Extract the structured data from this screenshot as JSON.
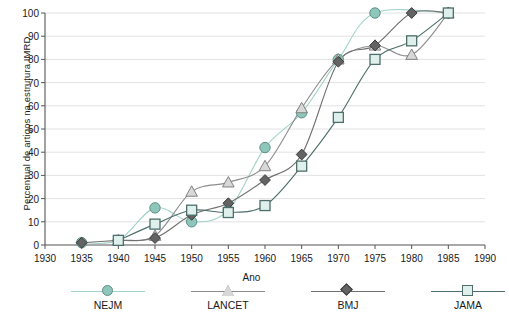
{
  "chart_data": {
    "type": "line",
    "title": "",
    "xlabel": "Ano",
    "ylabel": "Percentual de artigos na estrutura IMRD",
    "xlim": [
      1930,
      1990
    ],
    "ylim": [
      0,
      100
    ],
    "x": [
      1935,
      1940,
      1945,
      1950,
      1955,
      1960,
      1965,
      1970,
      1975,
      1980,
      1985
    ],
    "xticks": [
      1930,
      1935,
      1940,
      1945,
      1950,
      1955,
      1960,
      1965,
      1970,
      1975,
      1980,
      1985,
      1990
    ],
    "yticks": [
      0,
      10,
      20,
      30,
      40,
      50,
      60,
      70,
      80,
      90,
      100
    ],
    "grid": "horizontal",
    "legend_position": "bottom",
    "series": [
      {
        "name": "NEJM",
        "marker": "circle",
        "color": "#8fc6bb",
        "line_color": "#9fd2c8",
        "x": [
          1935,
          1940,
          1945,
          1950,
          1955,
          1960,
          1965,
          1970,
          1975,
          1985
        ],
        "values": [
          1,
          2,
          16,
          10,
          15,
          42,
          57,
          80,
          100,
          100
        ]
      },
      {
        "name": "LANCET",
        "marker": "triangle",
        "color": "#d8d8d8",
        "line_color": "#8c8c8c",
        "x": [
          1940,
          1945,
          1950,
          1955,
          1960,
          1965,
          1970,
          1975,
          1980,
          1985
        ],
        "values": [
          2,
          4,
          23,
          27,
          34,
          59,
          80,
          86,
          82,
          100
        ]
      },
      {
        "name": "BMJ",
        "marker": "diamond",
        "color": "#636363",
        "line_color": "#6f6f6f",
        "x": [
          1935,
          1940,
          1945,
          1950,
          1955,
          1960,
          1965,
          1970,
          1975,
          1980,
          1985
        ],
        "values": [
          1,
          2,
          3,
          13,
          18,
          28,
          39,
          79,
          86,
          100,
          100
        ]
      },
      {
        "name": "JAMA",
        "marker": "square",
        "color": "#dff0ec",
        "line_color": "#4d6e6a",
        "x": [
          1940,
          1945,
          1950,
          1955,
          1960,
          1965,
          1970,
          1975,
          1980,
          1985
        ],
        "values": [
          2,
          9,
          15,
          14,
          17,
          34,
          55,
          80,
          88,
          100
        ]
      }
    ]
  },
  "axes": {
    "ylabel": "Percentual de artigos na estrutura IMRD",
    "xlabel": "Ano"
  },
  "legend": {
    "items": [
      {
        "label": "NEJM",
        "marker": "circle-marker"
      },
      {
        "label": "LANCET",
        "marker": "triangle-marker"
      },
      {
        "label": "BMJ",
        "marker": "diamond-marker"
      },
      {
        "label": "JAMA",
        "marker": "square-marker"
      }
    ]
  }
}
